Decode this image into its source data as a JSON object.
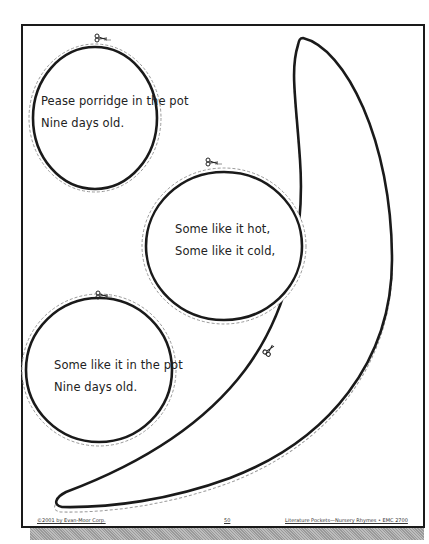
{
  "page": {
    "colors": {
      "line": "#1a1a1a",
      "dashed": "#9a9a9a",
      "text": "#222222"
    }
  },
  "cutouts": {
    "circle1": {
      "lines": [
        "Pease porridge in the pot",
        "Nine days old."
      ]
    },
    "circle2": {
      "lines": [
        "Some like it hot,",
        "Some like it cold,"
      ]
    },
    "circle3": {
      "lines": [
        "Some like it in the pot",
        "Nine days old."
      ]
    },
    "crescent": {
      "icon": "scissors-icon"
    }
  },
  "footer": {
    "copyright": "©2001 by Evan-Moor Corp.",
    "page_number": "50",
    "series": "Literature Pockets—Nursery Rhymes • EMC 2700"
  }
}
